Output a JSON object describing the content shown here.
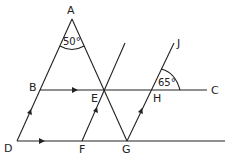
{
  "diagram": {
    "points": {
      "A": "A",
      "B": "B",
      "C": "C",
      "D": "D",
      "E": "E",
      "F": "F",
      "G": "G",
      "H": "H",
      "J": "J"
    },
    "angles": {
      "at_A": "50°",
      "at_H": "65°"
    },
    "colors": {
      "line": "#222222",
      "background": "#ffffff"
    }
  }
}
